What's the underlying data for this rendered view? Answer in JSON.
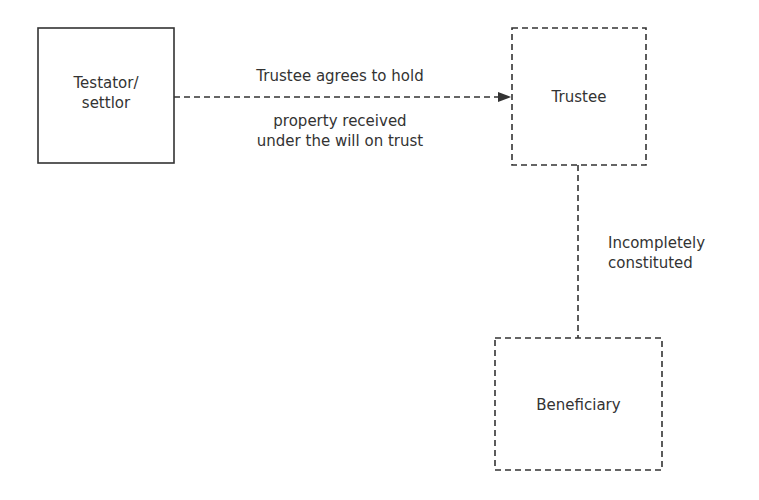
{
  "nodes": {
    "testator": {
      "label_line1": "Testator/",
      "label_line2": "settlor",
      "border": "solid"
    },
    "trustee": {
      "label": "Trustee",
      "border": "dashed"
    },
    "beneficiary": {
      "label": "Beneficiary",
      "border": "dashed"
    }
  },
  "edges": {
    "testator_to_trustee": {
      "label_above": "Trustee agrees to hold",
      "label_below_line1": "property received",
      "label_below_line2": "under the will on trust",
      "style": "dashed-arrow"
    },
    "trustee_to_beneficiary": {
      "label_line1": "Incompletely",
      "label_line2": "constituted",
      "style": "dashed"
    }
  },
  "colors": {
    "stroke": "#333333",
    "text": "#333333",
    "background": "#ffffff"
  }
}
